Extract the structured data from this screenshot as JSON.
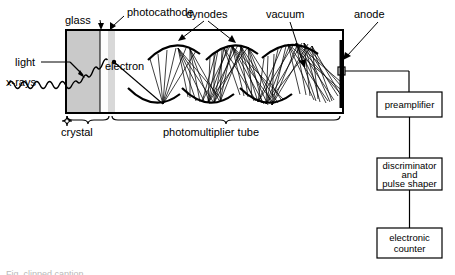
{
  "figure": {
    "colors": {
      "stroke": "#000000",
      "crystal_fill": "#c9c9c9",
      "glass_fill": "#ffffff",
      "photocathode_fill": "#d8d8d8",
      "tube_fill": "#ffffff",
      "background": "#ffffff"
    }
  },
  "labels": {
    "glass": "glass",
    "photocathode": "photocathode",
    "dynodes": "dynodes",
    "vacuum": "vacuum",
    "anode": "anode",
    "light": "light",
    "xrays": "x-rays",
    "electron": "electron",
    "crystal": "crystal",
    "pmt": "photomultiplier tube"
  },
  "chain": {
    "boxes": [
      {
        "id": "preamplifier",
        "lines": [
          "preamplifier"
        ]
      },
      {
        "id": "discriminator",
        "lines": [
          "discriminator",
          "and",
          "pulse shaper"
        ]
      },
      {
        "id": "counter",
        "lines": [
          "electronic",
          "counter"
        ]
      }
    ]
  },
  "caption": {
    "text": "Fig. clipped caption"
  }
}
